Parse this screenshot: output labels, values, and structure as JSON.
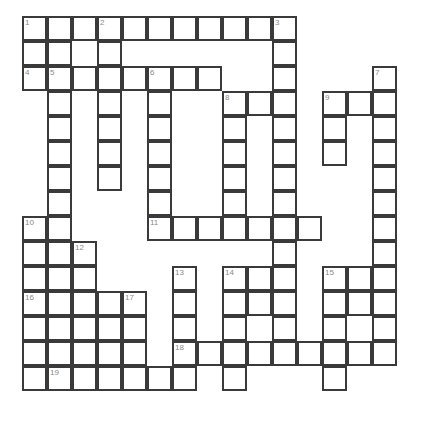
{
  "puzzle": {
    "type": "crossword-grid",
    "title": "Crossword Puzzle Grid",
    "background_color": "#ffffff",
    "cell_border_color": "#3a3a3a",
    "cell_fill_color": "#ffffff",
    "number_color": "#8a8a8a",
    "cell_size": 25,
    "origin_x": 22,
    "origin_y": 16,
    "columns": 16,
    "rows": 16,
    "clue_count": 19,
    "cells": [
      {
        "c": 0,
        "r": 0,
        "n": "1"
      },
      {
        "c": 1,
        "r": 0,
        "n": ""
      },
      {
        "c": 2,
        "r": 0,
        "n": ""
      },
      {
        "c": 3,
        "r": 0,
        "n": "2"
      },
      {
        "c": 4,
        "r": 0,
        "n": ""
      },
      {
        "c": 5,
        "r": 0,
        "n": ""
      },
      {
        "c": 6,
        "r": 0,
        "n": ""
      },
      {
        "c": 7,
        "r": 0,
        "n": ""
      },
      {
        "c": 8,
        "r": 0,
        "n": ""
      },
      {
        "c": 9,
        "r": 0,
        "n": ""
      },
      {
        "c": 10,
        "r": 0,
        "n": "3"
      },
      {
        "c": 0,
        "r": 1,
        "n": ""
      },
      {
        "c": 1,
        "r": 1,
        "n": ""
      },
      {
        "c": 3,
        "r": 1,
        "n": ""
      },
      {
        "c": 10,
        "r": 1,
        "n": ""
      },
      {
        "c": 0,
        "r": 2,
        "n": "4"
      },
      {
        "c": 1,
        "r": 2,
        "n": "5"
      },
      {
        "c": 2,
        "r": 2,
        "n": ""
      },
      {
        "c": 3,
        "r": 2,
        "n": ""
      },
      {
        "c": 4,
        "r": 2,
        "n": ""
      },
      {
        "c": 5,
        "r": 2,
        "n": "6"
      },
      {
        "c": 6,
        "r": 2,
        "n": ""
      },
      {
        "c": 7,
        "r": 2,
        "n": ""
      },
      {
        "c": 10,
        "r": 2,
        "n": ""
      },
      {
        "c": 14,
        "r": 2,
        "n": "7"
      },
      {
        "c": 1,
        "r": 3,
        "n": ""
      },
      {
        "c": 3,
        "r": 3,
        "n": ""
      },
      {
        "c": 5,
        "r": 3,
        "n": ""
      },
      {
        "c": 8,
        "r": 3,
        "n": "8"
      },
      {
        "c": 9,
        "r": 3,
        "n": ""
      },
      {
        "c": 10,
        "r": 3,
        "n": ""
      },
      {
        "c": 12,
        "r": 3,
        "n": "9"
      },
      {
        "c": 13,
        "r": 3,
        "n": ""
      },
      {
        "c": 14,
        "r": 3,
        "n": ""
      },
      {
        "c": 1,
        "r": 4,
        "n": ""
      },
      {
        "c": 3,
        "r": 4,
        "n": ""
      },
      {
        "c": 5,
        "r": 4,
        "n": ""
      },
      {
        "c": 8,
        "r": 4,
        "n": ""
      },
      {
        "c": 10,
        "r": 4,
        "n": ""
      },
      {
        "c": 12,
        "r": 4,
        "n": ""
      },
      {
        "c": 14,
        "r": 4,
        "n": ""
      },
      {
        "c": 1,
        "r": 5,
        "n": ""
      },
      {
        "c": 3,
        "r": 5,
        "n": ""
      },
      {
        "c": 5,
        "r": 5,
        "n": ""
      },
      {
        "c": 8,
        "r": 5,
        "n": ""
      },
      {
        "c": 10,
        "r": 5,
        "n": ""
      },
      {
        "c": 12,
        "r": 5,
        "n": ""
      },
      {
        "c": 14,
        "r": 5,
        "n": ""
      },
      {
        "c": 1,
        "r": 6,
        "n": ""
      },
      {
        "c": 3,
        "r": 6,
        "n": ""
      },
      {
        "c": 5,
        "r": 6,
        "n": ""
      },
      {
        "c": 8,
        "r": 6,
        "n": ""
      },
      {
        "c": 10,
        "r": 6,
        "n": ""
      },
      {
        "c": 14,
        "r": 6,
        "n": ""
      },
      {
        "c": 1,
        "r": 7,
        "n": ""
      },
      {
        "c": 5,
        "r": 7,
        "n": ""
      },
      {
        "c": 8,
        "r": 7,
        "n": ""
      },
      {
        "c": 10,
        "r": 7,
        "n": ""
      },
      {
        "c": 14,
        "r": 7,
        "n": ""
      },
      {
        "c": 0,
        "r": 8,
        "n": "10"
      },
      {
        "c": 1,
        "r": 8,
        "n": ""
      },
      {
        "c": 5,
        "r": 8,
        "n": "11"
      },
      {
        "c": 6,
        "r": 8,
        "n": ""
      },
      {
        "c": 7,
        "r": 8,
        "n": ""
      },
      {
        "c": 8,
        "r": 8,
        "n": ""
      },
      {
        "c": 9,
        "r": 8,
        "n": ""
      },
      {
        "c": 10,
        "r": 8,
        "n": ""
      },
      {
        "c": 11,
        "r": 8,
        "n": ""
      },
      {
        "c": 14,
        "r": 8,
        "n": ""
      },
      {
        "c": 0,
        "r": 9,
        "n": ""
      },
      {
        "c": 1,
        "r": 9,
        "n": ""
      },
      {
        "c": 2,
        "r": 9,
        "n": "12"
      },
      {
        "c": 10,
        "r": 9,
        "n": ""
      },
      {
        "c": 14,
        "r": 9,
        "n": ""
      },
      {
        "c": 0,
        "r": 10,
        "n": ""
      },
      {
        "c": 1,
        "r": 10,
        "n": ""
      },
      {
        "c": 2,
        "r": 10,
        "n": ""
      },
      {
        "c": 6,
        "r": 10,
        "n": "13"
      },
      {
        "c": 8,
        "r": 10,
        "n": "14"
      },
      {
        "c": 9,
        "r": 10,
        "n": ""
      },
      {
        "c": 10,
        "r": 10,
        "n": ""
      },
      {
        "c": 12,
        "r": 10,
        "n": "15"
      },
      {
        "c": 13,
        "r": 10,
        "n": ""
      },
      {
        "c": 14,
        "r": 10,
        "n": ""
      },
      {
        "c": 0,
        "r": 11,
        "n": "16"
      },
      {
        "c": 1,
        "r": 11,
        "n": ""
      },
      {
        "c": 2,
        "r": 11,
        "n": ""
      },
      {
        "c": 3,
        "r": 11,
        "n": ""
      },
      {
        "c": 4,
        "r": 11,
        "n": "17"
      },
      {
        "c": 6,
        "r": 11,
        "n": ""
      },
      {
        "c": 8,
        "r": 11,
        "n": ""
      },
      {
        "c": 9,
        "r": 11,
        "n": ""
      },
      {
        "c": 10,
        "r": 11,
        "n": ""
      },
      {
        "c": 12,
        "r": 11,
        "n": ""
      },
      {
        "c": 13,
        "r": 11,
        "n": ""
      },
      {
        "c": 14,
        "r": 11,
        "n": ""
      },
      {
        "c": 0,
        "r": 12,
        "n": ""
      },
      {
        "c": 1,
        "r": 12,
        "n": ""
      },
      {
        "c": 2,
        "r": 12,
        "n": ""
      },
      {
        "c": 3,
        "r": 12,
        "n": ""
      },
      {
        "c": 4,
        "r": 12,
        "n": ""
      },
      {
        "c": 6,
        "r": 12,
        "n": ""
      },
      {
        "c": 8,
        "r": 12,
        "n": ""
      },
      {
        "c": 10,
        "r": 12,
        "n": ""
      },
      {
        "c": 12,
        "r": 12,
        "n": ""
      },
      {
        "c": 14,
        "r": 12,
        "n": ""
      },
      {
        "c": 0,
        "r": 13,
        "n": ""
      },
      {
        "c": 1,
        "r": 13,
        "n": ""
      },
      {
        "c": 2,
        "r": 13,
        "n": ""
      },
      {
        "c": 3,
        "r": 13,
        "n": ""
      },
      {
        "c": 4,
        "r": 13,
        "n": ""
      },
      {
        "c": 6,
        "r": 13,
        "n": "18"
      },
      {
        "c": 7,
        "r": 13,
        "n": ""
      },
      {
        "c": 8,
        "r": 13,
        "n": ""
      },
      {
        "c": 9,
        "r": 13,
        "n": ""
      },
      {
        "c": 10,
        "r": 13,
        "n": ""
      },
      {
        "c": 11,
        "r": 13,
        "n": ""
      },
      {
        "c": 12,
        "r": 13,
        "n": ""
      },
      {
        "c": 13,
        "r": 13,
        "n": ""
      },
      {
        "c": 14,
        "r": 13,
        "n": ""
      },
      {
        "c": 0,
        "r": 14,
        "n": ""
      },
      {
        "c": 1,
        "r": 14,
        "n": "19"
      },
      {
        "c": 2,
        "r": 14,
        "n": ""
      },
      {
        "c": 3,
        "r": 14,
        "n": ""
      },
      {
        "c": 4,
        "r": 14,
        "n": ""
      },
      {
        "c": 5,
        "r": 14,
        "n": ""
      },
      {
        "c": 6,
        "r": 14,
        "n": ""
      },
      {
        "c": 8,
        "r": 14,
        "n": ""
      },
      {
        "c": 12,
        "r": 14,
        "n": ""
      }
    ]
  }
}
